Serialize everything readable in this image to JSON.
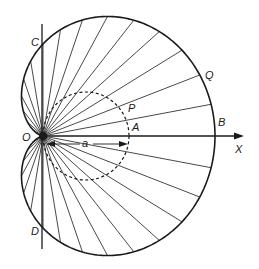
{
  "figure": {
    "type": "cardioid-construction",
    "origin": {
      "x": 43,
      "y": 136
    },
    "scale_x": 86,
    "scale_y": 92,
    "ray_step_deg": 10,
    "dashed_circle": {
      "cx": 86,
      "cy": 136,
      "rx": 43,
      "ry": 44
    },
    "colors": {
      "stroke": "#1a1a1a",
      "background": "#ffffff"
    }
  },
  "labels": {
    "C": "C",
    "D": "D",
    "O": "O",
    "P": "P",
    "Q": "Q",
    "A": "A",
    "B": "B",
    "X": "X",
    "a": "a"
  }
}
